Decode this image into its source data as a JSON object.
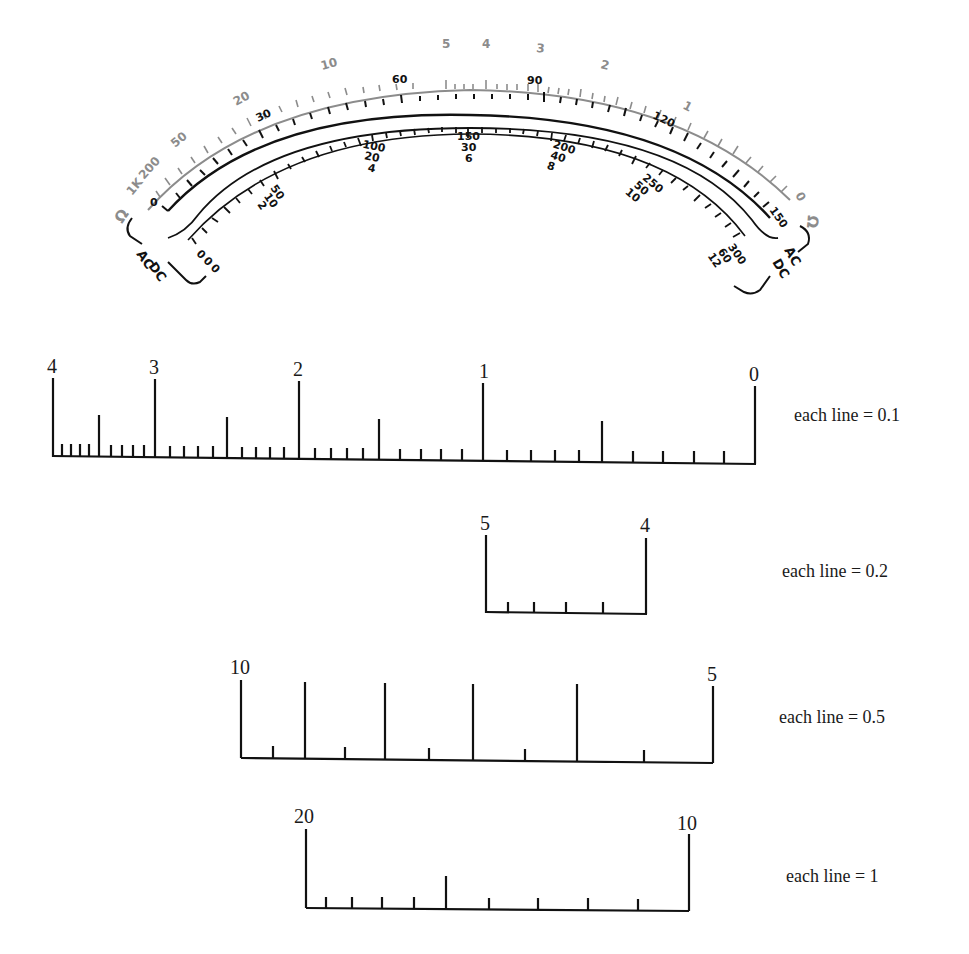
{
  "meter": {
    "ohm_scale": {
      "color": "#8c8c8c",
      "unit_label": "Ω",
      "labels": [
        "1K",
        "200",
        "50",
        "20",
        "10",
        "5",
        "4",
        "3",
        "2",
        "1",
        "0"
      ]
    },
    "voltage_scale_upper": {
      "color": "#111111",
      "labels": [
        "0",
        "30",
        "60",
        "90",
        "120",
        "150"
      ]
    },
    "voltage_scale_lower": {
      "color": "#111111",
      "label_groups": [
        {
          "lines": [
            "0",
            "0",
            "0"
          ]
        },
        {
          "lines": [
            "50",
            "10",
            "2"
          ]
        },
        {
          "lines": [
            "100",
            "20",
            "4"
          ]
        },
        {
          "lines": [
            "150",
            "30",
            "6"
          ]
        },
        {
          "lines": [
            "200",
            "40",
            "8"
          ]
        },
        {
          "lines": [
            "250",
            "50",
            "10"
          ]
        },
        {
          "lines": [
            "300",
            "60",
            "12"
          ]
        }
      ]
    },
    "left_bracket": {
      "top": "AC",
      "bottom": "DC"
    },
    "right_bracket": {
      "top": "AC",
      "bottom": "DC"
    }
  },
  "scales": [
    {
      "left_label": "4",
      "mid_labels": [
        "3",
        "2",
        "1"
      ],
      "right_label": "0",
      "caption": "each line = 0.1"
    },
    {
      "left_label": "5",
      "right_label": "4",
      "caption": "each line = 0.2"
    },
    {
      "left_label": "10",
      "right_label": "5",
      "caption": "each line = 0.5"
    },
    {
      "left_label": "20",
      "right_label": "10",
      "caption": "each line = 1"
    }
  ]
}
